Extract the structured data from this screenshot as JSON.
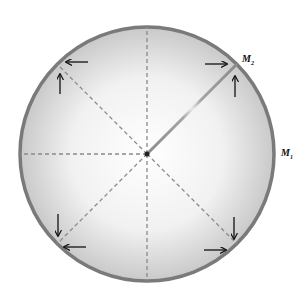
{
  "diagram": {
    "labels": {
      "m1": "M",
      "m1_sub": "1",
      "m2": "M",
      "m2_sub": "2"
    },
    "circle": {
      "cx": 147,
      "cy": 154,
      "r": 127,
      "stroke": "#7a7a7a"
    },
    "vectors": [
      {
        "name": "M1",
        "angle_deg": 0,
        "color": "#8a8a8a"
      },
      {
        "name": "M2",
        "angle_deg": 45,
        "color": "#9a9a9a"
      }
    ],
    "dashed_axes_deg": [
      90,
      135,
      180,
      225,
      270,
      315
    ],
    "arrow_markers": [
      {
        "position": "top-left",
        "directions": [
          "left",
          "up"
        ]
      },
      {
        "position": "top-right",
        "directions": [
          "right",
          "up"
        ]
      },
      {
        "position": "bottom-left",
        "directions": [
          "left",
          "down"
        ]
      },
      {
        "position": "bottom-right",
        "directions": [
          "right",
          "down"
        ]
      }
    ]
  }
}
